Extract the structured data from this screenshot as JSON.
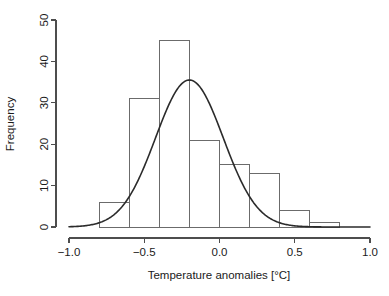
{
  "chart_data": {
    "type": "bar",
    "title": "",
    "subtitle": "",
    "xlabel": "Temperature anomalies [°C]",
    "ylabel": "Frequency",
    "xlim": [
      -1.0,
      1.0
    ],
    "ylim": [
      0,
      50
    ],
    "grid": false,
    "legend": null,
    "bin_width": 0.2,
    "bin_edges": [
      -0.8,
      -0.6,
      -0.4,
      -0.2,
      0.0,
      0.2,
      0.4,
      0.6,
      0.8
    ],
    "categories": [
      "-0.8 to -0.6",
      "-0.6 to -0.4",
      "-0.4 to -0.2",
      "-0.2 to 0.0",
      "0.0 to 0.2",
      "0.2 to 0.4",
      "0.4 to 0.6",
      "0.6 to 0.8"
    ],
    "values": [
      6,
      31,
      45,
      21,
      15,
      13,
      4,
      1
    ],
    "x_ticks": [
      -1.0,
      -0.5,
      0.0,
      0.5,
      1.0
    ],
    "x_tick_labels": [
      "-1.0",
      "-0.5",
      "0.0",
      "0.5",
      "1.0"
    ],
    "y_ticks": [
      0,
      10,
      20,
      30,
      40,
      50
    ],
    "y_tick_labels": [
      "0",
      "10",
      "20",
      "30",
      "40",
      "50"
    ],
    "overlay": {
      "type": "line",
      "name": "normal density curve",
      "mean": -0.2,
      "sd": 0.225,
      "peak_value": 35.5,
      "scale_note": "normal curve scaled to counts (n * bin_width)"
    },
    "colors": {
      "bar_stroke": "#6b6b6b",
      "bar_fill": "none",
      "curve": "#2b2b2b",
      "axis": "#4d4d4d",
      "text": "#1a1a1a",
      "background": "#ffffff"
    }
  },
  "labels": {
    "x_axis_title": "Temperature anomalies [°C]",
    "y_axis_title": "Frequency"
  }
}
